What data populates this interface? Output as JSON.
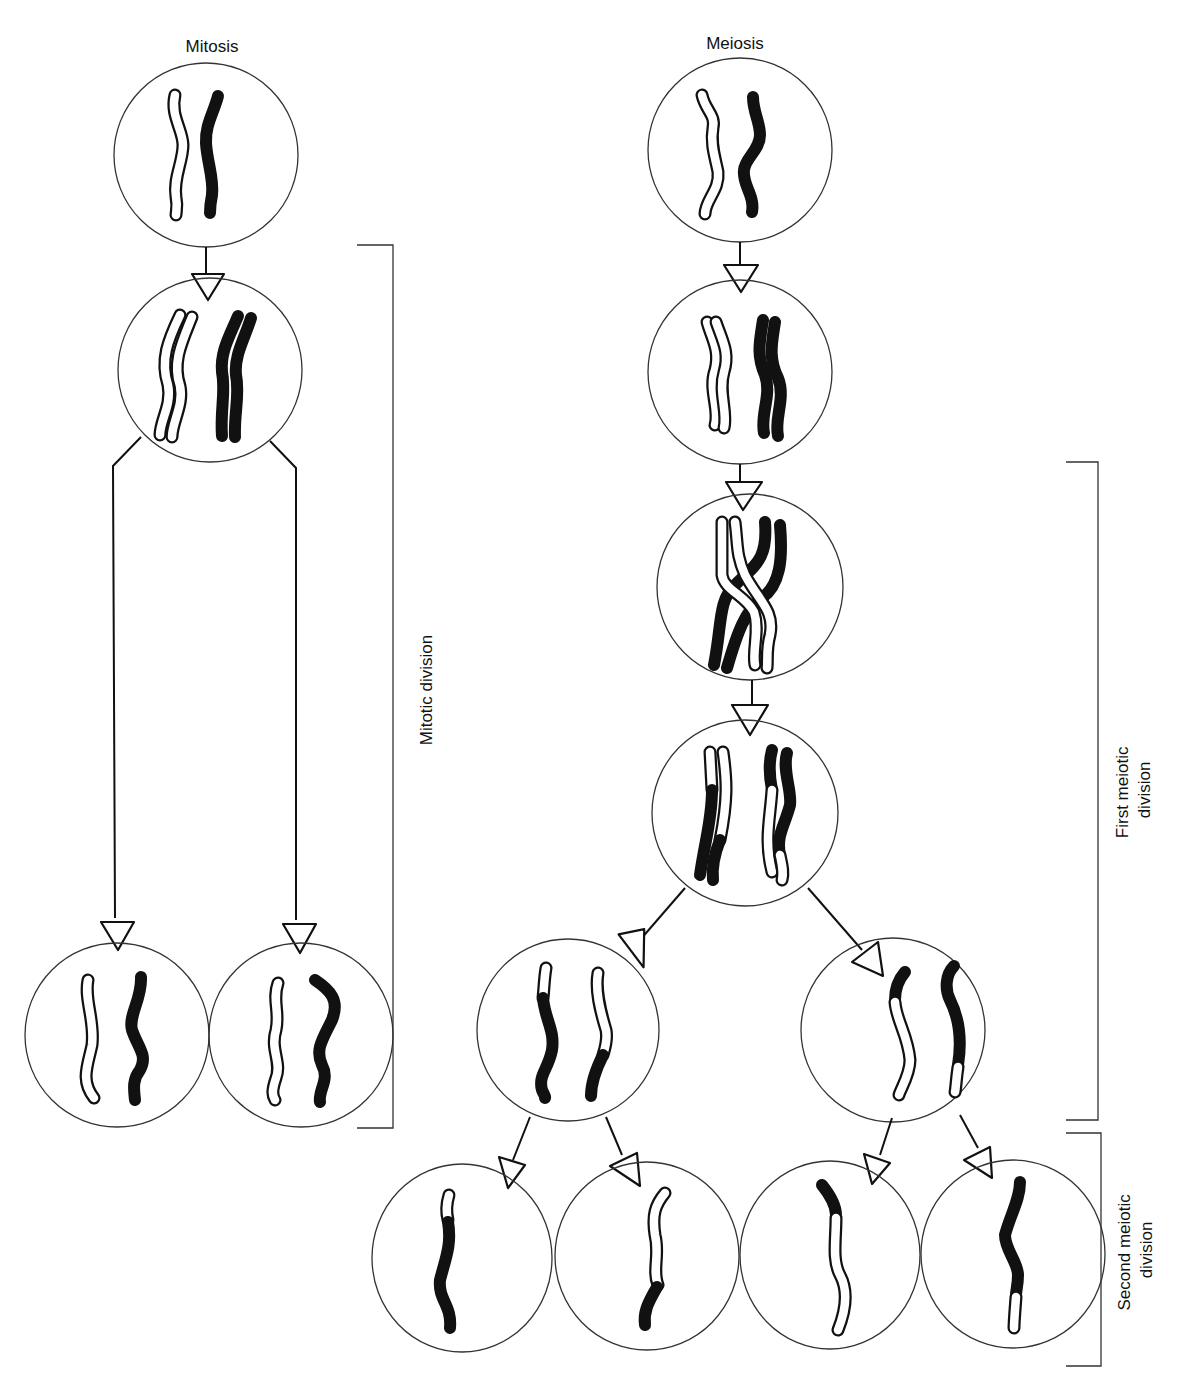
{
  "diagram": {
    "left_panel": {
      "title": "Mitosis",
      "stages": [
        "parent cell (homologous pair)",
        "replicated chromosomes",
        "two daughter cells"
      ],
      "bracket_label": "Mitotic division"
    },
    "right_panel": {
      "title": "Meiosis",
      "stages": [
        "parent cell (homologous pair)",
        "replicated chromosomes",
        "crossing over (chiasma)",
        "recombinant chromatids",
        "two cells after first division",
        "four gametes after second division"
      ],
      "bracket_labels": {
        "first": [
          "First meiotic",
          "division"
        ],
        "second": [
          "Second meiotic",
          "division"
        ]
      }
    },
    "colors": {
      "background": "#ffffff",
      "ink": "#111111",
      "cell_outline": "#333333",
      "maternal_chromosome": "#ffffff",
      "paternal_chromosome": "#111111"
    }
  }
}
